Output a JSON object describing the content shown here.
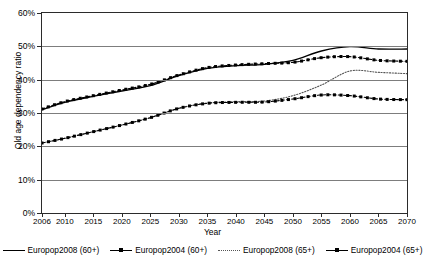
{
  "title_remnant": "· · · · · · · · ·",
  "axes": {
    "y": {
      "title": "Old age dependency ratio",
      "ticks": [
        "0%",
        "10%",
        "20%",
        "30%",
        "40%",
        "50%",
        "60%"
      ],
      "min": 0,
      "max": 60
    },
    "x": {
      "title": "Year",
      "ticks": [
        "2006",
        "2010",
        "2015",
        "2020",
        "2025",
        "2030",
        "2035",
        "2040",
        "2045",
        "2050",
        "2055",
        "2060",
        "2065",
        "2070"
      ]
    }
  },
  "legend": {
    "items": [
      {
        "label": "Europop2008 (60+)",
        "style": "solid",
        "marker": false,
        "color": "#000000"
      },
      {
        "label": "Europop2004 (60+)",
        "style": "dashmark",
        "marker": true,
        "color": "#000000"
      },
      {
        "label": "Europop2008 (65+)",
        "style": "dotted",
        "marker": false,
        "color": "#555555"
      },
      {
        "label": "Europop2004 (65+)",
        "style": "dashmark",
        "marker": true,
        "color": "#000000"
      }
    ]
  },
  "chart_data": {
    "type": "line",
    "title": "",
    "xlabel": "Year",
    "ylabel": "Old age dependency ratio",
    "ylim": [
      0,
      60
    ],
    "grid": true,
    "legend_position": "bottom",
    "x": [
      2006,
      2010,
      2015,
      2020,
      2025,
      2030,
      2035,
      2040,
      2045,
      2050,
      2055,
      2060,
      2065,
      2070
    ],
    "series": [
      {
        "name": "Europop2008 (60+)",
        "style": "solid",
        "marker": "none",
        "color": "#000000",
        "values": [
          31.0,
          33.2,
          35.0,
          36.6,
          38.2,
          41.2,
          43.4,
          44.2,
          44.6,
          45.8,
          48.6,
          49.9,
          49.2,
          49.2
        ]
      },
      {
        "name": "Europop2004 (60+)",
        "style": "dashed",
        "marker": "square",
        "color": "#000000",
        "values": [
          31.2,
          33.4,
          35.2,
          36.9,
          38.6,
          41.4,
          43.6,
          44.4,
          44.8,
          45.2,
          46.6,
          46.9,
          45.8,
          45.5
        ]
      },
      {
        "name": "Europop2008 (65+)",
        "style": "dotted",
        "marker": "none",
        "color": "#555555",
        "values": [
          21.0,
          22.4,
          24.4,
          26.4,
          28.6,
          31.4,
          33.0,
          33.4,
          33.6,
          35.2,
          38.4,
          42.6,
          42.2,
          41.8
        ]
      },
      {
        "name": "Europop2004 (65+)",
        "style": "dashdot",
        "marker": "square",
        "color": "#000000",
        "values": [
          21.0,
          22.4,
          24.4,
          26.4,
          28.6,
          31.4,
          32.9,
          33.2,
          33.3,
          34.2,
          35.4,
          35.2,
          34.2,
          34.0
        ]
      }
    ]
  }
}
